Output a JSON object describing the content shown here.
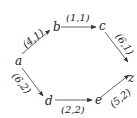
{
  "diagram": {
    "type": "directed-graph",
    "colors": {
      "edge": "#555555",
      "text": "#222222",
      "background": "#ffffff"
    },
    "nodes": [
      {
        "id": "a",
        "label": "a",
        "x": 19,
        "y": 64
      },
      {
        "id": "b",
        "label": "b",
        "x": 56,
        "y": 31
      },
      {
        "id": "c",
        "label": "c",
        "x": 102,
        "y": 30
      },
      {
        "id": "z",
        "label": "z",
        "x": 131,
        "y": 80
      },
      {
        "id": "d",
        "label": "d",
        "x": 48,
        "y": 104
      },
      {
        "id": "e",
        "label": "e",
        "x": 98,
        "y": 104
      }
    ],
    "edges": [
      {
        "from": "a",
        "to": "b",
        "label": "(4,1)"
      },
      {
        "from": "b",
        "to": "c",
        "label": "(1,1)"
      },
      {
        "from": "c",
        "to": "z",
        "label": "(6,1)"
      },
      {
        "from": "a",
        "to": "d",
        "label": "(6,2)"
      },
      {
        "from": "d",
        "to": "e",
        "label": "(2,2)"
      },
      {
        "from": "e",
        "to": "z",
        "label": "(5,2)"
      }
    ]
  }
}
